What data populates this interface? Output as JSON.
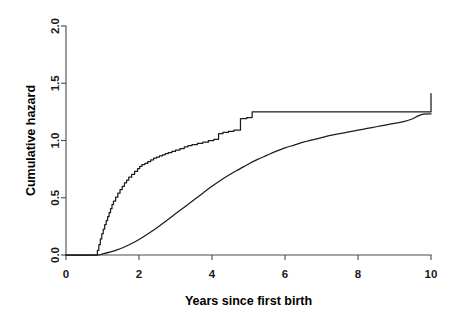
{
  "figure": {
    "title": "",
    "background": "#ffffff",
    "line_color": "#1c1c1c",
    "axis_color": "#4a4a4a"
  },
  "axes": {
    "x": {
      "label": "Years since first birth",
      "ticks": [
        "0",
        "2",
        "4",
        "6",
        "8",
        "10"
      ],
      "tick_values": [
        0,
        2,
        4,
        6,
        8,
        10
      ],
      "range": [
        0,
        10
      ],
      "pixel_origin": 66,
      "pixel_per_unit": 36.5
    },
    "y": {
      "label": "Cumulative hazard",
      "ticks": [
        "0.0",
        "0.5",
        "1.0",
        "1.5",
        "2.0"
      ],
      "tick_values": [
        0.0,
        0.5,
        1.0,
        1.5,
        2.0
      ],
      "range": [
        0,
        2
      ],
      "pixel_origin": 255,
      "pixel_per_unit": 114.5
    }
  },
  "chart_data": {
    "type": "line",
    "title": "",
    "xlabel": "Years since first birth",
    "ylabel": "Cumulative hazard",
    "xlim": [
      0,
      10
    ],
    "ylim": [
      0,
      2.0
    ],
    "xticks": [
      0,
      2,
      4,
      6,
      8,
      10
    ],
    "yticks": [
      0.0,
      0.5,
      1.0,
      1.5,
      2.0
    ],
    "grid": false,
    "legend": null,
    "legend_position": "none",
    "series": [
      {
        "name": "Nelson-Aalen cumulative hazard (step)",
        "style": "step",
        "color": "#1c1c1c",
        "x": [
          0.0,
          0.8,
          0.86,
          0.9,
          0.94,
          0.98,
          1.02,
          1.06,
          1.1,
          1.14,
          1.18,
          1.22,
          1.26,
          1.3,
          1.36,
          1.42,
          1.48,
          1.54,
          1.6,
          1.66,
          1.72,
          1.8,
          1.88,
          1.96,
          2.02,
          2.08,
          2.16,
          2.24,
          2.32,
          2.4,
          2.48,
          2.56,
          2.64,
          2.72,
          2.8,
          2.9,
          3.0,
          3.12,
          3.24,
          3.34,
          3.45,
          3.6,
          3.75,
          3.9,
          4.05,
          4.18,
          4.3,
          4.45,
          4.6,
          4.78,
          4.95,
          5.1,
          7.48,
          10.0
        ],
        "y": [
          0.0,
          0.0,
          0.04,
          0.09,
          0.14,
          0.185,
          0.225,
          0.265,
          0.3,
          0.335,
          0.37,
          0.405,
          0.44,
          0.47,
          0.505,
          0.54,
          0.57,
          0.6,
          0.63,
          0.655,
          0.68,
          0.705,
          0.73,
          0.755,
          0.775,
          0.79,
          0.8,
          0.815,
          0.83,
          0.845,
          0.855,
          0.865,
          0.875,
          0.885,
          0.895,
          0.905,
          0.915,
          0.93,
          0.945,
          0.955,
          0.965,
          0.975,
          0.985,
          1.0,
          1.01,
          1.06,
          1.07,
          1.08,
          1.09,
          1.19,
          1.2,
          1.25,
          1.25,
          1.41
        ]
      },
      {
        "name": "Smooth cumulative hazard (parametric fit)",
        "style": "smooth",
        "color": "#1c1c1c",
        "x": [
          0.0,
          0.85,
          1.0,
          1.2,
          1.4,
          1.6,
          1.8,
          2.0,
          2.25,
          2.5,
          2.75,
          3.0,
          3.25,
          3.5,
          3.75,
          4.0,
          4.25,
          4.5,
          4.75,
          5.0,
          5.25,
          5.5,
          5.75,
          6.0,
          6.25,
          6.5,
          6.75,
          7.0,
          7.25,
          7.5,
          7.75,
          8.0,
          8.25,
          8.5,
          8.75,
          9.0,
          9.25,
          9.5,
          9.65,
          9.8,
          10.0
        ],
        "y": [
          0.0,
          0.0,
          0.01,
          0.025,
          0.045,
          0.07,
          0.1,
          0.135,
          0.185,
          0.24,
          0.3,
          0.36,
          0.42,
          0.48,
          0.54,
          0.6,
          0.655,
          0.705,
          0.75,
          0.795,
          0.835,
          0.87,
          0.905,
          0.935,
          0.96,
          0.985,
          1.005,
          1.025,
          1.045,
          1.06,
          1.075,
          1.09,
          1.105,
          1.12,
          1.135,
          1.15,
          1.165,
          1.19,
          1.215,
          1.23,
          1.232
        ]
      }
    ]
  }
}
